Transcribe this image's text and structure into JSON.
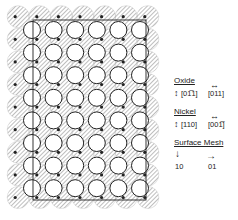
{
  "diagram": {
    "grid": {
      "rows": 8,
      "cols": 6,
      "x0": 32,
      "y0": 30,
      "dx": 21.6,
      "dy": 22.6,
      "open_radius": 8.5,
      "hatched_radius": 11
    },
    "frame": {
      "x": 33,
      "y": 20,
      "w": 113,
      "h": 180
    },
    "colors": {
      "ink": "#222222",
      "hatch": "#888888",
      "background": "#ffffff"
    }
  },
  "legend": {
    "oxide": {
      "heading": "Oxide",
      "dir1": "[01̅1]",
      "dir2": "[011]"
    },
    "nickel": {
      "heading": "Nickel",
      "dir1": "[110]",
      "dir2": "[001̅]"
    },
    "mesh": {
      "heading": "Surface Mesh",
      "dir1": "10",
      "dir2": "01"
    }
  }
}
